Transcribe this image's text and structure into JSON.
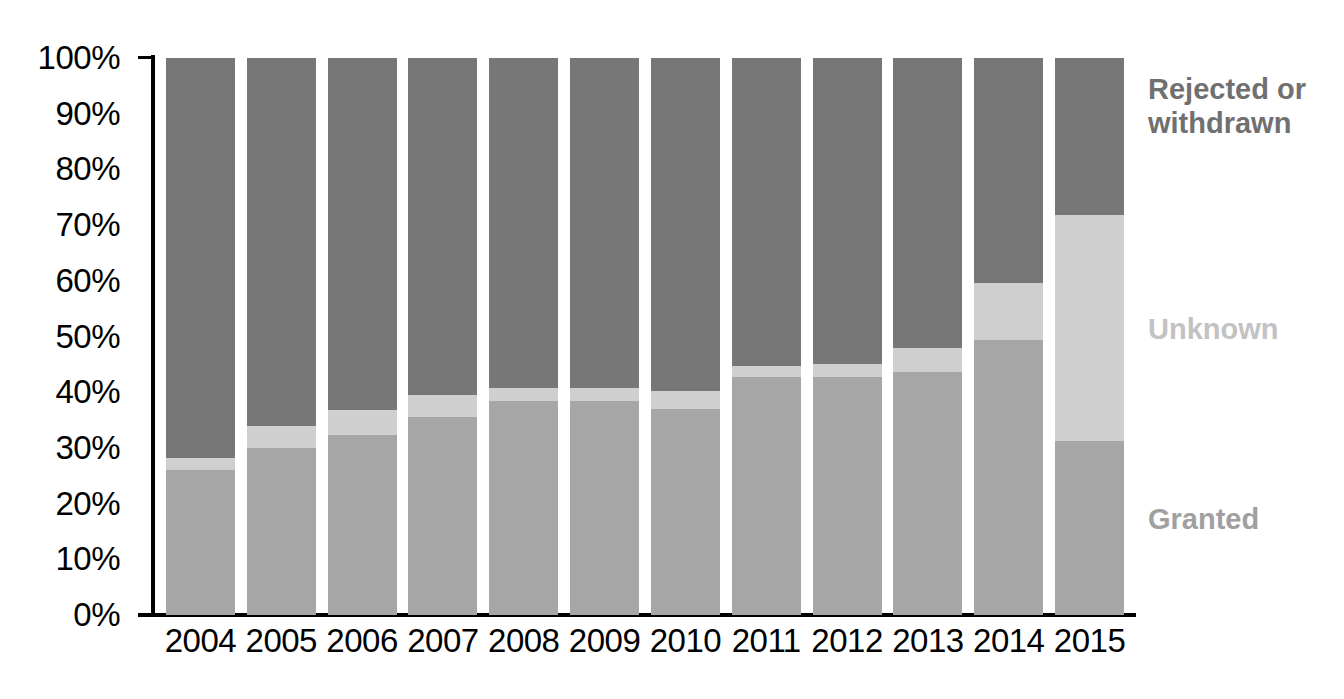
{
  "chart_data": {
    "type": "bar",
    "subtype": "stacked-100-percent",
    "title": "",
    "xlabel": "",
    "ylabel": "",
    "ylim": [
      0,
      100
    ],
    "yticks": [
      "0%",
      "10%",
      "20%",
      "30%",
      "40%",
      "50%",
      "60%",
      "70%",
      "80%",
      "90%",
      "100%"
    ],
    "ytick_values": [
      0,
      10,
      20,
      30,
      40,
      50,
      60,
      70,
      80,
      90,
      100
    ],
    "grid": false,
    "legend_position": "right",
    "categories": [
      "2004",
      "2005",
      "2006",
      "2007",
      "2008",
      "2009",
      "2010",
      "2011",
      "2012",
      "2013",
      "2014",
      "2015"
    ],
    "series": [
      {
        "name": "Granted",
        "color": "#a6a6a6",
        "values": [
          26.0,
          30.0,
          32.3,
          35.5,
          38.5,
          38.5,
          37.0,
          42.7,
          42.8,
          43.7,
          49.3,
          31.3
        ]
      },
      {
        "name": "Unknown",
        "color": "#cfcfcf",
        "values": [
          2.2,
          4.0,
          4.5,
          4.0,
          2.3,
          2.2,
          3.2,
          2.0,
          2.3,
          4.3,
          10.3,
          40.5
        ]
      },
      {
        "name": "Rejected or withdrawn",
        "color": "#777777",
        "values": [
          71.8,
          66.0,
          63.2,
          60.5,
          59.2,
          59.3,
          59.8,
          55.3,
          54.9,
          52.0,
          40.4,
          28.2
        ]
      }
    ]
  },
  "legend": {
    "rejected_line1": "Rejected or",
    "rejected_line2": "withdrawn",
    "unknown": "Unknown",
    "granted": "Granted"
  }
}
